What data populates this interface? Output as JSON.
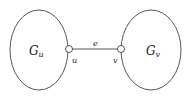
{
  "diagram": {
    "subgraphs": [
      {
        "id": "left",
        "label": "G",
        "sub": "u",
        "cx": 39,
        "cy": 50,
        "rx": 29,
        "ry": 40
      },
      {
        "id": "right",
        "label": "G",
        "sub": "v",
        "cx": 151,
        "cy": 50,
        "rx": 30,
        "ry": 40
      }
    ],
    "nodes": [
      {
        "id": "u",
        "label": "u",
        "x": 69,
        "y": 49
      },
      {
        "id": "v",
        "label": "v",
        "x": 121,
        "y": 49
      }
    ],
    "edge": {
      "label": "e",
      "from": "u",
      "to": "v"
    },
    "colors": {
      "stroke": "#444444",
      "text": "#222222"
    }
  }
}
